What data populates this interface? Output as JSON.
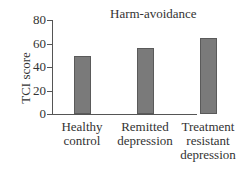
{
  "chart_data": {
    "type": "bar",
    "title": "Harm-avoidance",
    "xlabel": "",
    "ylabel": "TCI score",
    "ylim": [
      0,
      80
    ],
    "yticks": [
      0,
      20,
      40,
      60,
      80
    ],
    "categories": [
      "Healthy control",
      "Remitted depression",
      "Treatment resistant depression"
    ],
    "category_lines": [
      [
        "Healthy",
        "control"
      ],
      [
        "Remitted",
        "depression"
      ],
      [
        "Treatment",
        "resistant",
        "depression"
      ]
    ],
    "values": [
      49,
      56,
      65
    ],
    "bar_color": "#7a7a7a",
    "grid": false,
    "legend": null
  }
}
